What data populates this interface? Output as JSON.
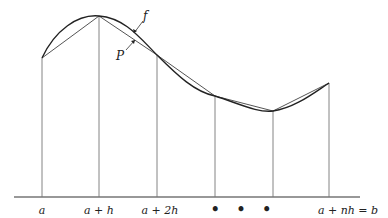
{
  "figure": {
    "type": "diagram",
    "curve_label": "f",
    "polyline_label": "P",
    "axis_labels": [
      "a",
      "a + h",
      "a + 2h",
      "• • •",
      "a + nh = b"
    ],
    "nodes": [
      {
        "x": 42,
        "y": 58
      },
      {
        "x": 99,
        "y": 16
      },
      {
        "x": 157,
        "y": 55
      },
      {
        "x": 215,
        "y": 96
      },
      {
        "x": 273,
        "y": 111
      },
      {
        "x": 329,
        "y": 83
      }
    ],
    "baseline_y": 197,
    "colors": {
      "stroke": "#333333",
      "thin": "#666666"
    }
  }
}
